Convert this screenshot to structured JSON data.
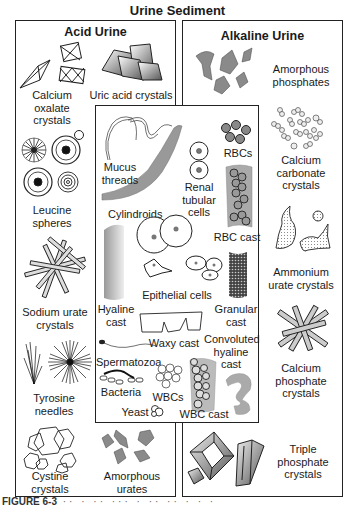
{
  "title": "Urine Sediment",
  "panels": {
    "acid": {
      "title": "Acid Urine",
      "items": [
        {
          "label": "Calcium\noxalate\ncrystals",
          "lines": [
            "Calcium",
            "oxalate",
            "crystals"
          ]
        },
        {
          "label": "Uric acid crystals",
          "lines": [
            "Uric acid crystals"
          ]
        },
        {
          "label": "Leucine spheres",
          "lines": [
            "Leucine",
            "spheres"
          ]
        },
        {
          "label": "Sodium urate crystals",
          "lines": [
            "Sodium urate",
            "crystals"
          ]
        },
        {
          "label": "Tyrosine needles",
          "lines": [
            "Tyrosine",
            "needles"
          ]
        },
        {
          "label": "Cystine crystals",
          "lines": [
            "Cystine",
            "crystals"
          ]
        },
        {
          "label": "Amorphous urates",
          "lines": [
            "Amorphous",
            "urates"
          ]
        }
      ]
    },
    "alkaline": {
      "title": "Alkaline Urine",
      "items": [
        {
          "label": "Amorphous phosphates",
          "lines": [
            "Amorphous",
            "phosphates"
          ]
        },
        {
          "label": "Calcium carbonate crystals",
          "lines": [
            "Calcium",
            "carbonate",
            "crystals"
          ]
        },
        {
          "label": "Ammonium urate crystals",
          "lines": [
            "Ammonium",
            "urate crystals"
          ]
        },
        {
          "label": "Calcium phosphate crystals",
          "lines": [
            "Calcium",
            "phosphate",
            "crystals"
          ]
        },
        {
          "label": "Triple phosphate crystals",
          "lines": [
            "Triple",
            "phosphate",
            "crystals"
          ]
        }
      ]
    },
    "center": {
      "items": [
        {
          "label": "Mucus threads",
          "lines": [
            "Mucus",
            "threads"
          ]
        },
        {
          "label": "RBCs",
          "lines": [
            "RBCs"
          ]
        },
        {
          "label": "Renal tubular cells",
          "lines": [
            "Renal",
            "tubular",
            "cells"
          ]
        },
        {
          "label": "Cylindroids",
          "lines": [
            "Cylindroids"
          ]
        },
        {
          "label": "RBC cast",
          "lines": [
            "RBC cast"
          ]
        },
        {
          "label": "Epithelial cells",
          "lines": [
            "Epithelial cells"
          ]
        },
        {
          "label": "Hyaline cast",
          "lines": [
            "Hyaline",
            "cast"
          ]
        },
        {
          "label": "Granular cast",
          "lines": [
            "Granular",
            "cast"
          ]
        },
        {
          "label": "Waxy cast",
          "lines": [
            "Waxy cast"
          ]
        },
        {
          "label": "Convoluted hyaline cast",
          "lines": [
            "Convoluted",
            "hyaline",
            "cast"
          ]
        },
        {
          "label": "Spermatozoa",
          "lines": [
            "Spermatozoa"
          ]
        },
        {
          "label": "Bacteria",
          "lines": [
            "Bacteria"
          ]
        },
        {
          "label": "WBCs",
          "lines": [
            "WBCs"
          ]
        },
        {
          "label": "Yeast",
          "lines": [
            "Yeast"
          ]
        },
        {
          "label": "WBC cast",
          "lines": [
            "WBC cast"
          ]
        }
      ]
    }
  },
  "caption": {
    "figure": "FIGURE 6-3"
  }
}
